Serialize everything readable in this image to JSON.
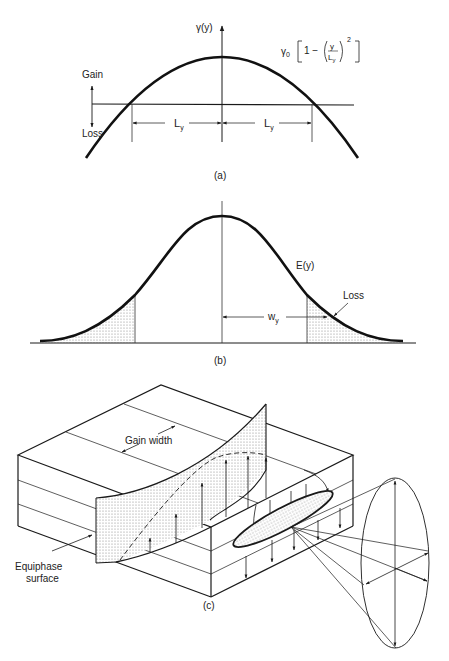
{
  "panel_a": {
    "caption": "(a)",
    "axis_label": "γ(y)",
    "formula": {
      "prefix": "γ",
      "subscript": "0",
      "one_minus": "1 −",
      "numerator": "y",
      "denominator": "L",
      "denominator_sub": "y",
      "exponent": "2"
    },
    "gain_label": "Gain",
    "loss_label": "Loss",
    "left_dimension": {
      "label": "L",
      "sub": "y"
    },
    "right_dimension": {
      "label": "L",
      "sub": "y"
    }
  },
  "panel_b": {
    "caption": "(b)",
    "curve_label": "E(y)",
    "loss_label": "Loss",
    "width_dimension": {
      "label": "w",
      "sub": "y"
    }
  },
  "panel_c": {
    "caption": "(c)",
    "gain_width_label": "Gain width",
    "equiphase_label_line1": "Equiphase",
    "equiphase_label_line2": "surface"
  },
  "colors": {
    "line": "#1a1a1a",
    "thin_line": "#333333",
    "stipple": "#bdbdbd",
    "background": "#ffffff"
  }
}
